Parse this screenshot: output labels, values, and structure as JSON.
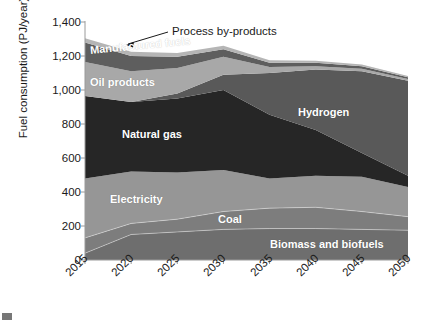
{
  "chart_data": {
    "type": "area",
    "stacked": true,
    "title": "",
    "xlabel": "",
    "ylabel": "Fuel consumption (PJ/year)",
    "x": [
      2015,
      2020,
      2025,
      2030,
      2035,
      2040,
      2045,
      2050
    ],
    "xtick_labels": [
      "2015",
      "2020",
      "2025",
      "2030",
      "2035",
      "2040",
      "2045",
      "2050"
    ],
    "ytick_labels": [
      "0",
      "200",
      "400",
      "600",
      "800",
      "1,000",
      "1,200",
      "1,400"
    ],
    "ytick_values": [
      0,
      200,
      400,
      600,
      800,
      1000,
      1200,
      1400
    ],
    "ylim": [
      0,
      1400
    ],
    "xlim": [
      2015,
      2050
    ],
    "grid": false,
    "legend_position": "inline-labels",
    "series": [
      {
        "name": "Biomass and biofuels",
        "color": "#6e6e6e",
        "label_color": "#ffffff",
        "values": [
          40,
          150,
          165,
          180,
          185,
          185,
          180,
          175
        ]
      },
      {
        "name": "Coal",
        "color": "#7d7d7d",
        "label_color": "#ffffff",
        "values": [
          90,
          65,
          75,
          105,
          120,
          125,
          105,
          80
        ]
      },
      {
        "name": "Electricity",
        "color": "#969696",
        "label_color": "#ffffff",
        "values": [
          350,
          305,
          275,
          245,
          175,
          185,
          205,
          175
        ]
      },
      {
        "name": "Natural gas",
        "color": "#262626",
        "label_color": "#ffffff",
        "values": [
          485,
          410,
          435,
          470,
          375,
          270,
          140,
          65
        ]
      },
      {
        "name": "Hydrogen",
        "color": "#595959",
        "label_color": "#ffffff",
        "values": [
          0,
          0,
          30,
          90,
          245,
          355,
          480,
          560
        ]
      },
      {
        "name": "Oil products",
        "color": "#a8a8a8",
        "label_color": "#ffffff",
        "values": [
          200,
          180,
          150,
          105,
          35,
          20,
          15,
          10
        ]
      },
      {
        "name": "Manufactured fuels",
        "color": "#5e5e5e",
        "label_color": "#ffffff",
        "values": [
          115,
          90,
          65,
          45,
          25,
          20,
          15,
          10
        ]
      },
      {
        "name": "Process by-products",
        "color": "#b5b5b5",
        "label_color": "#1a1a1a",
        "values": [
          25,
          25,
          22,
          20,
          15,
          12,
          10,
          8
        ]
      }
    ],
    "annotations": [
      {
        "text": "Process by-products",
        "type": "callout-with-arrow"
      }
    ]
  },
  "labels": {
    "process_by_products": "Process by-products",
    "manufactured_fuels": "Manufactured fuels",
    "oil_products": "Oil products",
    "natural_gas": "Natural gas",
    "hydrogen": "Hydrogen",
    "electricity": "Electricity",
    "coal": "Coal",
    "biomass": "Biomass and biofuels"
  }
}
